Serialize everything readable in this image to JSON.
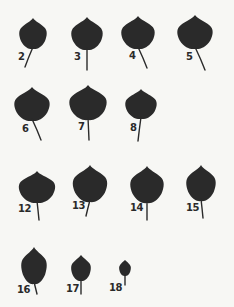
{
  "figure": {
    "background": "#f7f7f4",
    "leaf_color": "#2a2a2a",
    "leaves": [
      {
        "id": "2",
        "label": "2",
        "cx": 33,
        "top": 18,
        "w": 28,
        "h": 31,
        "stem_end": [
          25,
          67
        ],
        "label_pos": [
          18,
          52
        ]
      },
      {
        "id": "3",
        "label": "3",
        "cx": 87,
        "top": 17,
        "w": 32,
        "h": 33,
        "stem_end": [
          87,
          70
        ],
        "label_pos": [
          74,
          52
        ]
      },
      {
        "id": "4",
        "label": "4",
        "cx": 138,
        "top": 16,
        "w": 34,
        "h": 33,
        "stem_end": [
          147,
          68
        ],
        "label_pos": [
          129,
          51
        ]
      },
      {
        "id": "5",
        "label": "5",
        "cx": 195,
        "top": 15,
        "w": 36,
        "h": 34,
        "stem_end": [
          205,
          70
        ],
        "label_pos": [
          186,
          52
        ]
      },
      {
        "id": "6",
        "label": "6",
        "cx": 32,
        "top": 87,
        "w": 36,
        "h": 34,
        "stem_end": [
          41,
          140
        ],
        "label_pos": [
          22,
          124
        ]
      },
      {
        "id": "7",
        "label": "7",
        "cx": 88,
        "top": 85,
        "w": 38,
        "h": 35,
        "stem_end": [
          89,
          140
        ],
        "label_pos": [
          78,
          122
        ]
      },
      {
        "id": "8",
        "label": "8",
        "cx": 141,
        "top": 89,
        "w": 32,
        "h": 30,
        "stem_end": [
          138,
          141
        ],
        "label_pos": [
          130,
          123
        ]
      },
      {
        "id": "12",
        "label": "12",
        "cx": 37,
        "top": 171,
        "w": 37,
        "h": 32,
        "stem_end": [
          39,
          220
        ],
        "label_pos": [
          18,
          204
        ]
      },
      {
        "id": "13",
        "label": "13",
        "cx": 90,
        "top": 165,
        "w": 35,
        "h": 37,
        "stem_end": [
          86,
          216
        ],
        "label_pos": [
          72,
          201
        ]
      },
      {
        "id": "14",
        "label": "14",
        "cx": 147,
        "top": 166,
        "w": 34,
        "h": 37,
        "stem_end": [
          147,
          220
        ],
        "label_pos": [
          130,
          203
        ]
      },
      {
        "id": "15",
        "label": "15",
        "cx": 201,
        "top": 165,
        "w": 30,
        "h": 36,
        "stem_end": [
          203,
          218
        ],
        "label_pos": [
          186,
          203
        ]
      },
      {
        "id": "16",
        "label": "16",
        "cx": 34,
        "top": 247,
        "w": 26,
        "h": 37,
        "stem_end": [
          37,
          294
        ],
        "label_pos": [
          17,
          285
        ]
      },
      {
        "id": "17",
        "label": "17",
        "cx": 81,
        "top": 255,
        "w": 20,
        "h": 26,
        "stem_end": [
          81,
          294
        ],
        "label_pos": [
          66,
          284
        ]
      },
      {
        "id": "18",
        "label": "18",
        "cx": 125,
        "top": 260,
        "w": 12,
        "h": 16,
        "stem_end": [
          125,
          285
        ],
        "label_pos": [
          109,
          283
        ]
      }
    ]
  }
}
